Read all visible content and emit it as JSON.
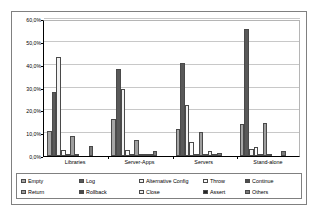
{
  "chart_data": {
    "type": "bar",
    "title": "",
    "xlabel": "",
    "ylabel": "",
    "categories": [
      "Libraries",
      "Server-Apps",
      "Servers",
      "Stand-alone"
    ],
    "ylim": [
      0,
      60
    ],
    "y_ticks": [
      "0,0%",
      "10,0%",
      "20,0%",
      "30,0%",
      "40,0%",
      "50,0%",
      "60,0%"
    ],
    "y_tick_values": [
      0,
      10,
      20,
      30,
      40,
      50,
      60
    ],
    "grid": true,
    "legend_position": "bottom",
    "value_suffix": "%",
    "series": [
      {
        "name": "Empty",
        "color": "#a6a6a6",
        "values": [
          11.0,
          16.0,
          12.0,
          14.0
        ]
      },
      {
        "name": "Log",
        "color": "#595959",
        "values": [
          28.2,
          38.2,
          40.6,
          55.8
        ]
      },
      {
        "name": "Alternative Config",
        "color": "#f2f2f2",
        "values": [
          43.4,
          29.5,
          22.5,
          3.0
        ]
      },
      {
        "name": "Throw",
        "color": "#fafafa",
        "values": [
          2.8,
          2.8,
          6.2,
          3.8
        ]
      },
      {
        "name": "Continue",
        "color": "#4d4d4d",
        "values": [
          0.4,
          0.3,
          0.3,
          0.4
        ]
      },
      {
        "name": "Return",
        "color": "#9e9e9e",
        "values": [
          8.8,
          7.0,
          10.5,
          14.4
        ]
      },
      {
        "name": "Rollback",
        "color": "#4a4a4a",
        "values": [
          0.2,
          0.9,
          0.2,
          0.2
        ]
      },
      {
        "name": "Close",
        "color": "#ededed",
        "values": [
          0.0,
          0.3,
          2.1,
          0.0
        ]
      },
      {
        "name": "Assert",
        "color": "#262626",
        "values": [
          0.0,
          0.8,
          0.1,
          0.0
        ]
      },
      {
        "name": "Others",
        "color": "#7a7a7a",
        "values": [
          4.2,
          2.0,
          1.2,
          2.1
        ]
      }
    ]
  },
  "legend": {
    "items": [
      {
        "label": "Empty"
      },
      {
        "label": "Log"
      },
      {
        "label": "Alternative Config"
      },
      {
        "label": "Throw"
      },
      {
        "label": "Continue"
      },
      {
        "label": "Return"
      },
      {
        "label": "Rollback"
      },
      {
        "label": "Close"
      },
      {
        "label": "Assert"
      },
      {
        "label": "Others"
      }
    ]
  }
}
